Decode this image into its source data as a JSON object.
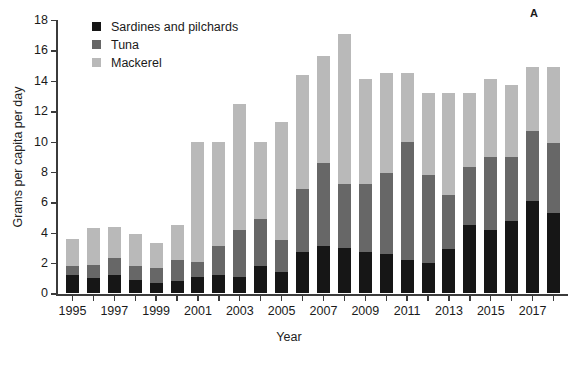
{
  "chart_data": {
    "type": "bar",
    "stacked": true,
    "title": "",
    "panel_label": "A",
    "xlabel": "Year",
    "ylabel": "Grams per capita per day",
    "ylim": [
      0,
      18
    ],
    "ytick_labels": [
      "0",
      "2",
      "4",
      "6",
      "8",
      "10",
      "12",
      "14",
      "16",
      "18"
    ],
    "ytick_values": [
      0,
      2,
      4,
      6,
      8,
      10,
      12,
      14,
      16,
      18
    ],
    "grid": false,
    "legend_position": "top-left",
    "categories": [
      "1995",
      "1996",
      "1997",
      "1998",
      "1999",
      "2000",
      "2001",
      "2002",
      "2003",
      "2004",
      "2005",
      "2006",
      "2007",
      "2008",
      "2009",
      "2010",
      "2011",
      "2012",
      "2013",
      "2014",
      "2015",
      "2016",
      "2017",
      "2018"
    ],
    "xtick_labels": [
      "1995",
      "1997",
      "1999",
      "2001",
      "2003",
      "2005",
      "2007",
      "2009",
      "2011",
      "2013",
      "2015",
      "2017"
    ],
    "series": [
      {
        "name": "Sardines and pilchards",
        "color": "#161616",
        "values": [
          1.2,
          1.0,
          1.2,
          0.9,
          0.7,
          0.8,
          1.1,
          1.2,
          1.1,
          1.8,
          1.4,
          2.7,
          3.1,
          3.0,
          2.7,
          2.6,
          2.2,
          2.0,
          2.9,
          4.5,
          4.2,
          4.8,
          6.1,
          5.3
        ]
      },
      {
        "name": "Tuna",
        "color": "#676767",
        "values": [
          0.6,
          0.9,
          1.1,
          0.9,
          1.0,
          1.4,
          1.0,
          1.9,
          3.1,
          3.1,
          2.1,
          4.2,
          5.5,
          4.2,
          4.5,
          5.3,
          7.8,
          5.8,
          3.6,
          3.8,
          4.8,
          4.2,
          4.6,
          4.6
        ]
      },
      {
        "name": "Mackerel",
        "color": "#b9b9b9",
        "values": [
          1.8,
          2.4,
          2.1,
          2.1,
          1.6,
          2.3,
          7.9,
          6.9,
          8.3,
          5.1,
          7.8,
          7.5,
          7.0,
          9.9,
          6.9,
          6.6,
          4.5,
          5.4,
          6.7,
          4.9,
          5.1,
          4.7,
          4.2,
          5.0
        ]
      }
    ],
    "totals": [
      3.6,
      4.3,
      4.4,
      3.9,
      3.3,
      4.5,
      10.0,
      10.0,
      12.5,
      10.0,
      11.3,
      14.4,
      15.6,
      17.1,
      14.1,
      14.5,
      14.5,
      13.2,
      13.2,
      13.2,
      14.1,
      13.7,
      14.9,
      14.9
    ]
  },
  "legend": {
    "items": [
      {
        "label": "Sardines and pilchards",
        "color": "#161616"
      },
      {
        "label": "Tuna",
        "color": "#676767"
      },
      {
        "label": "Mackerel",
        "color": "#b9b9b9"
      }
    ]
  }
}
